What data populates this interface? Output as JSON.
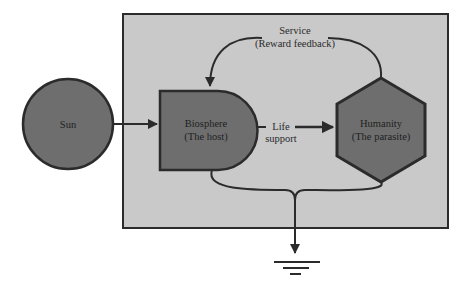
{
  "diagram": {
    "nodes": {
      "sun": {
        "label": "Sun"
      },
      "biosphere": {
        "line1": "Biosphere",
        "line2": "(The host)"
      },
      "humanity": {
        "line1": "Humanity",
        "line2": "(The parasite)"
      }
    },
    "edges": {
      "service": {
        "line1": "Service",
        "line2": "(Reward feedback)"
      },
      "life_support": {
        "line1": "Life",
        "line2": "support"
      }
    },
    "colors": {
      "panel": "#c9c9c9",
      "node_fill": "#6e6e6e",
      "stroke": "#2b2b2b",
      "background": "#ffffff"
    }
  }
}
